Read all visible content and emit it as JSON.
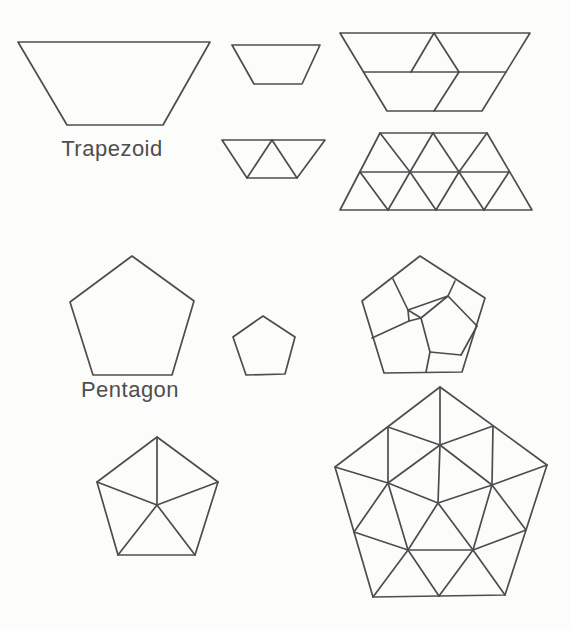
{
  "canvas": {
    "width": 570,
    "height": 629,
    "background": "#fcfcfb",
    "stroke_color": "#4d4d4d",
    "stroke_width": 1.7
  },
  "labels": {
    "trapezoid": "Trapezoid",
    "pentagon": "Pentagon"
  },
  "figures": [
    {
      "name": "trapezoid-plain-large",
      "description": "large plain trapezoid, long side on top",
      "outline": [
        [
          18,
          42
        ],
        [
          210,
          42
        ],
        [
          163,
          125
        ],
        [
          67,
          125
        ]
      ],
      "segments": []
    },
    {
      "name": "trapezoid-plain-small",
      "description": "small plain trapezoid, long side on top",
      "outline": [
        [
          232,
          45
        ],
        [
          320,
          45
        ],
        [
          302,
          84
        ],
        [
          254,
          84
        ]
      ],
      "segments": []
    },
    {
      "name": "trapezoid-three-triangles",
      "description": "small trapezoid divided into 3 equilateral triangles",
      "outline": [
        [
          222,
          140
        ],
        [
          325,
          140
        ],
        [
          297,
          178
        ],
        [
          247,
          178
        ]
      ],
      "segments": [
        [
          272,
          140,
          247,
          178
        ],
        [
          272,
          140,
          297,
          178
        ]
      ]
    },
    {
      "name": "trapezoid-five-pieces",
      "description": "large trapezoid divided into 3 trapezoids, 1 triangle and 1 rhombus",
      "outline": [
        [
          340,
          33
        ],
        [
          530,
          33
        ],
        [
          482,
          111
        ],
        [
          387,
          111
        ]
      ],
      "segments": [
        [
          364,
          72,
          506,
          72
        ],
        [
          434,
          33,
          411,
          72
        ],
        [
          434,
          33,
          459,
          72
        ],
        [
          459,
          72,
          434,
          111
        ]
      ]
    },
    {
      "name": "trapezoid-twelve-triangles",
      "description": "trapezoid divided into 12 unit triangles on a triangular grid",
      "outline": [
        [
          380,
          133
        ],
        [
          487,
          133
        ],
        [
          532,
          210
        ],
        [
          340,
          210
        ]
      ],
      "segments": [
        [
          360,
          172,
          509,
          172
        ],
        [
          380,
          133,
          410,
          172
        ],
        [
          410,
          172,
          433,
          133
        ],
        [
          433,
          133,
          459,
          172
        ],
        [
          459,
          172,
          487,
          133
        ],
        [
          360,
          172,
          388,
          210
        ],
        [
          388,
          210,
          410,
          172
        ],
        [
          410,
          172,
          436,
          210
        ],
        [
          436,
          210,
          459,
          172
        ],
        [
          459,
          172,
          484,
          210
        ],
        [
          484,
          210,
          509,
          172
        ]
      ]
    },
    {
      "name": "pentagon-plain-large",
      "description": "large plain regular pentagon",
      "outline": [
        [
          132,
          256
        ],
        [
          194,
          301
        ],
        [
          172,
          375
        ],
        [
          93,
          375
        ],
        [
          70,
          302
        ]
      ],
      "segments": []
    },
    {
      "name": "pentagon-plain-small",
      "description": "small plain regular pentagon",
      "outline": [
        [
          263,
          316
        ],
        [
          295,
          337
        ],
        [
          285,
          374
        ],
        [
          246,
          375
        ],
        [
          233,
          337
        ]
      ],
      "segments": []
    },
    {
      "name": "pentagon-six-pieces",
      "description": "pentagon divided into six pentagon-like pieces with a small triangle gap",
      "outline": [
        [
          420,
          256
        ],
        [
          485,
          298
        ],
        [
          462,
          372
        ],
        [
          384,
          373
        ],
        [
          362,
          301
        ]
      ],
      "segments": [
        [
          448,
          296,
          421,
          318
        ],
        [
          421,
          318,
          430,
          352
        ],
        [
          430,
          352,
          461,
          355
        ],
        [
          461,
          355,
          477,
          326
        ],
        [
          477,
          326,
          448,
          296
        ],
        [
          393,
          279,
          408,
          310
        ],
        [
          408,
          310,
          448,
          296
        ],
        [
          448,
          296,
          455,
          281
        ],
        [
          430,
          352,
          426,
          372
        ],
        [
          409,
          321,
          372,
          338
        ],
        [
          408,
          310,
          421,
          318
        ],
        [
          421,
          318,
          409,
          321
        ],
        [
          409,
          321,
          408,
          310
        ]
      ]
    },
    {
      "name": "pentagon-five-triangles",
      "description": "pentagon divided into 5 triangles fanned from center",
      "outline": [
        [
          157,
          437
        ],
        [
          218,
          482
        ],
        [
          195,
          555
        ],
        [
          118,
          555
        ],
        [
          97,
          482
        ]
      ],
      "segments": [
        [
          157,
          505,
          157,
          437
        ],
        [
          157,
          505,
          218,
          482
        ],
        [
          157,
          505,
          195,
          555
        ],
        [
          157,
          505,
          118,
          555
        ],
        [
          157,
          505,
          97,
          482
        ]
      ]
    },
    {
      "name": "pentagon-twenty-triangles",
      "description": "large pentagon triangulated into 20 triangles via edge midpoints, inner pentagon and center",
      "outline": [
        [
          440,
          387
        ],
        [
          547,
          465
        ],
        [
          505,
          595
        ],
        [
          373,
          597
        ],
        [
          335,
          467
        ]
      ],
      "segments": [
        [
          440,
          445,
          388,
          483
        ],
        [
          440,
          445,
          492,
          485
        ],
        [
          388,
          483,
          408,
          550
        ],
        [
          492,
          485,
          473,
          550
        ],
        [
          408,
          550,
          473,
          550
        ],
        [
          438,
          503,
          440,
          445
        ],
        [
          438,
          503,
          388,
          483
        ],
        [
          438,
          503,
          492,
          485
        ],
        [
          438,
          503,
          408,
          550
        ],
        [
          438,
          503,
          473,
          550
        ],
        [
          440,
          387,
          440,
          445
        ],
        [
          547,
          465,
          492,
          485
        ],
        [
          505,
          595,
          473,
          550
        ],
        [
          373,
          597,
          408,
          550
        ],
        [
          335,
          467,
          388,
          483
        ],
        [
          388,
          427,
          440,
          445
        ],
        [
          388,
          427,
          388,
          483
        ],
        [
          493,
          426,
          440,
          445
        ],
        [
          493,
          426,
          492,
          485
        ],
        [
          526,
          530,
          492,
          485
        ],
        [
          526,
          530,
          473,
          550
        ],
        [
          439,
          596,
          473,
          550
        ],
        [
          439,
          596,
          408,
          550
        ],
        [
          354,
          532,
          388,
          483
        ],
        [
          354,
          532,
          408,
          550
        ]
      ]
    }
  ]
}
